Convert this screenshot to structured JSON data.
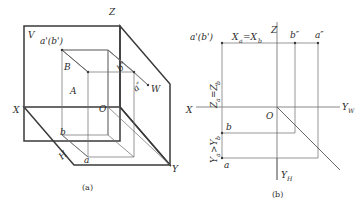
{
  "figure": {
    "captions": {
      "a": "(a)",
      "b": "(b)"
    }
  },
  "diagram_a": {
    "name": "pictorial-three-plane-projection",
    "plane_labels": {
      "v_plane": "V",
      "h_plane": "H",
      "w_plane": "W"
    },
    "axis_labels": {
      "z": "Z",
      "x": "X",
      "y": "Y"
    },
    "point_labels": {
      "origin": "O",
      "point_a_space": "A",
      "point_b_space": "B",
      "front_view_ab": "a'(b')",
      "side_view_b": "b″",
      "side_view_a": "a″",
      "top_view_a": "a",
      "top_view_b": "b"
    }
  },
  "diagram_b": {
    "name": "two-dimensional-projection-layout",
    "axis_labels": {
      "z": "Z",
      "x": "X",
      "y_w": "Y",
      "y_w_sub": "W",
      "y_h": "Y",
      "y_h_sub": "H"
    },
    "point_labels": {
      "origin": "O",
      "front_view_ab": "a'(b')",
      "side_view_b": "b″",
      "side_view_a": "a″",
      "top_view_a": "a",
      "top_view_b": "b"
    },
    "dimension_labels": {
      "x_equal": "X",
      "x_equal_sub1": "a",
      "x_equal_mid": " =X",
      "x_equal_sub2": "b",
      "z_equal": "Z",
      "z_equal_sub1": "a",
      "z_equal_mid": "=Z",
      "z_equal_sub2": "b",
      "y_compare": "Y",
      "y_compare_sub1": "a",
      "y_compare_mid": ">Y",
      "y_compare_sub2": "b"
    }
  },
  "colors": {
    "line_dark": "#3a3a3a",
    "line_light": "#6a6a6a",
    "text": "#2b2b2b",
    "background": "#ffffff"
  }
}
